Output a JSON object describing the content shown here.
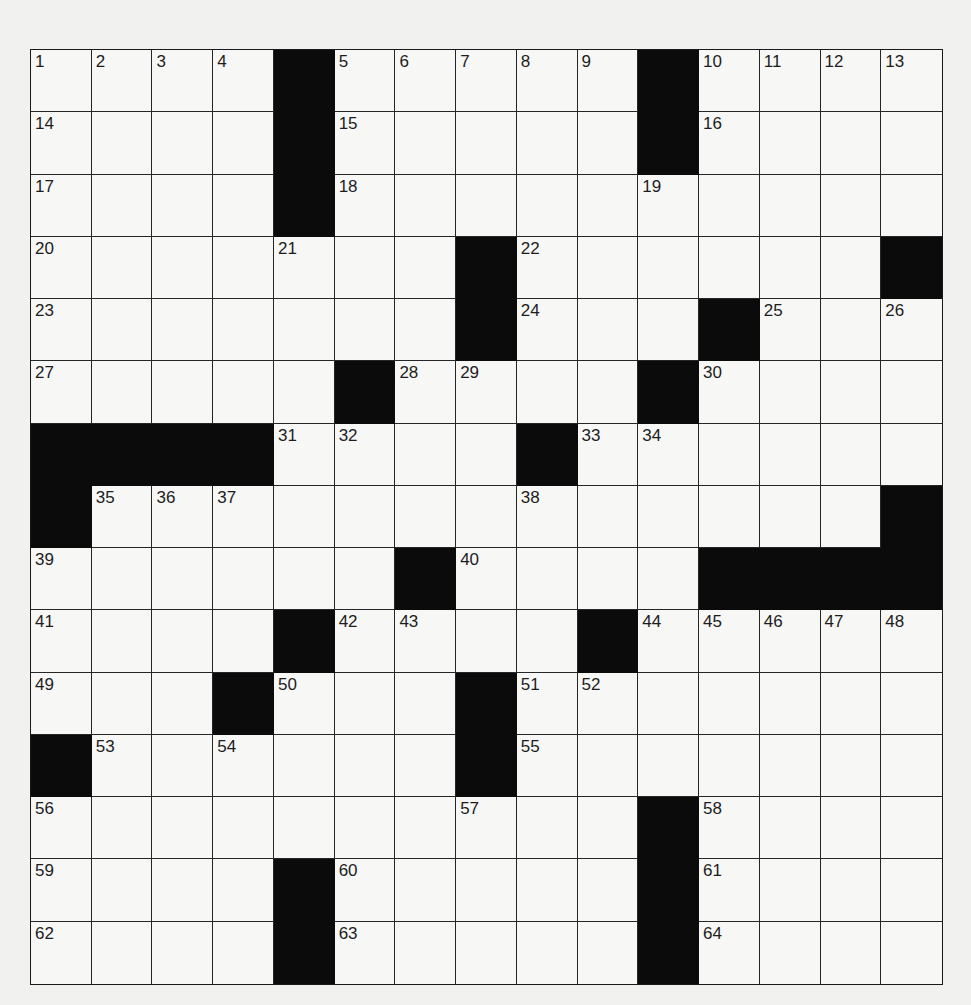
{
  "puzzle": {
    "rows": 15,
    "cols": 15,
    "colors": {
      "block": "#0b0b0b",
      "cell": "#f7f7f6",
      "line": "#262626",
      "background": "#f1f1f0"
    },
    "grid": [
      [
        "1",
        "2",
        "3",
        "4",
        "#",
        "5",
        "6",
        "7",
        "8",
        "9",
        "#",
        "10",
        "11",
        "12",
        "13"
      ],
      [
        "14",
        "",
        "",
        "",
        "#",
        "15",
        "",
        "",
        "",
        "",
        "#",
        "16",
        "",
        "",
        ""
      ],
      [
        "17",
        "",
        "",
        "",
        "#",
        "18",
        "",
        "",
        "",
        "",
        "19",
        "",
        "",
        "",
        ""
      ],
      [
        "20",
        "",
        "",
        "",
        "21",
        "",
        "",
        "#",
        "22",
        "",
        "",
        "",
        "",
        "",
        "#"
      ],
      [
        "23",
        "",
        "",
        "",
        "",
        "",
        "",
        "#",
        "24",
        "",
        "",
        "#",
        "25",
        "",
        "26"
      ],
      [
        "27",
        "",
        "",
        "",
        "",
        "#",
        "28",
        "29",
        "",
        "",
        "#",
        "30",
        "",
        "",
        ""
      ],
      [
        "#",
        "#",
        "#",
        "#",
        "31",
        "32",
        "",
        "",
        "#",
        "33",
        "34",
        "",
        "",
        "",
        ""
      ],
      [
        "#",
        "35",
        "36",
        "37",
        "",
        "",
        "",
        "",
        "38",
        "",
        "",
        "",
        "",
        "",
        "#"
      ],
      [
        "39",
        "",
        "",
        "",
        "",
        "",
        "#",
        "40",
        "",
        "",
        "",
        "#",
        "#",
        "#",
        "#"
      ],
      [
        "41",
        "",
        "",
        "",
        "#",
        "42",
        "43",
        "",
        "",
        "#",
        "44",
        "45",
        "46",
        "47",
        "48"
      ],
      [
        "49",
        "",
        "",
        "#",
        "50",
        "",
        "",
        "#",
        "51",
        "52",
        "",
        "",
        "",
        "",
        ""
      ],
      [
        "#",
        "53",
        "",
        "54",
        "",
        "",
        "",
        "#",
        "55",
        "",
        "",
        "",
        "",
        "",
        ""
      ],
      [
        "56",
        "",
        "",
        "",
        "",
        "",
        "",
        "57",
        "",
        "",
        "#",
        "58",
        "",
        "",
        ""
      ],
      [
        "59",
        "",
        "",
        "",
        "#",
        "60",
        "",
        "",
        "",
        "",
        "#",
        "61",
        "",
        "",
        ""
      ],
      [
        "62",
        "",
        "",
        "",
        "#",
        "63",
        "",
        "",
        "",
        "",
        "#",
        "64",
        "",
        "",
        ""
      ]
    ]
  }
}
